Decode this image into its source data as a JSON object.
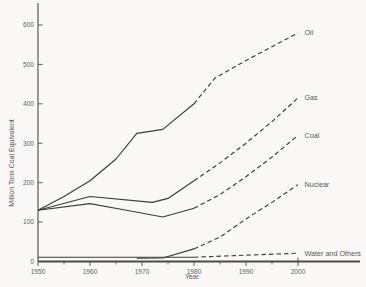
{
  "figure": {
    "background": "#f9f8f6",
    "line_color": "#3b3b3b",
    "text_color": "#585858"
  },
  "chart_data": {
    "type": "line",
    "title": "",
    "xlabel": "Year",
    "ylabel": "Million Tons Coal Equivalent",
    "x_range": [
      1950,
      2012
    ],
    "ylim": [
      0,
      620
    ],
    "x_major_ticks": [
      1950,
      1960,
      1970,
      1980,
      1990,
      2000
    ],
    "x_minor_ticks": [
      1955,
      1965,
      1975,
      1985,
      1995
    ],
    "y_ticks": [
      0,
      100,
      200,
      300,
      400,
      500,
      600
    ],
    "grid": "off",
    "legend_position": "inline-right-of-line-end",
    "series": [
      {
        "name": "Oil",
        "label": "Oil",
        "solid": [
          [
            1950,
            130
          ],
          [
            1955,
            165
          ],
          [
            1960,
            205
          ],
          [
            1965,
            260
          ],
          [
            1969,
            325
          ],
          [
            1974,
            335
          ],
          [
            1980,
            400
          ]
        ],
        "dashed": [
          [
            1980,
            400
          ],
          [
            1984,
            465
          ],
          [
            1990,
            510
          ],
          [
            1995,
            545
          ],
          [
            2000,
            580
          ]
        ]
      },
      {
        "name": "Gas",
        "label": "Gas",
        "solid": [
          [
            1950,
            130
          ],
          [
            1960,
            165
          ],
          [
            1972,
            150
          ],
          [
            1975,
            160
          ],
          [
            1980,
            205
          ]
        ],
        "dashed": [
          [
            1980,
            205
          ],
          [
            1985,
            250
          ],
          [
            1990,
            300
          ],
          [
            1995,
            355
          ],
          [
            2000,
            415
          ]
        ]
      },
      {
        "name": "Coal",
        "label": "Coal",
        "solid": [
          [
            1950,
            130
          ],
          [
            1960,
            147
          ],
          [
            1967,
            130
          ],
          [
            1974,
            113
          ],
          [
            1980,
            135
          ]
        ],
        "dashed": [
          [
            1980,
            135
          ],
          [
            1985,
            170
          ],
          [
            1990,
            215
          ],
          [
            1995,
            265
          ],
          [
            2000,
            320
          ]
        ]
      },
      {
        "name": "Nuclear",
        "label": "Nuclear",
        "solid": [
          [
            1969,
            8
          ],
          [
            1974,
            9
          ],
          [
            1980,
            32
          ]
        ],
        "dashed": [
          [
            1980,
            32
          ],
          [
            1985,
            62
          ],
          [
            1990,
            108
          ],
          [
            1995,
            150
          ],
          [
            2000,
            195
          ]
        ]
      },
      {
        "name": "Water and Others",
        "label": "Water and Others",
        "solid": [
          [
            1950,
            11
          ],
          [
            1980,
            11
          ]
        ],
        "dashed": [
          [
            1980,
            11
          ],
          [
            1990,
            16
          ],
          [
            2000,
            21
          ]
        ]
      }
    ]
  }
}
